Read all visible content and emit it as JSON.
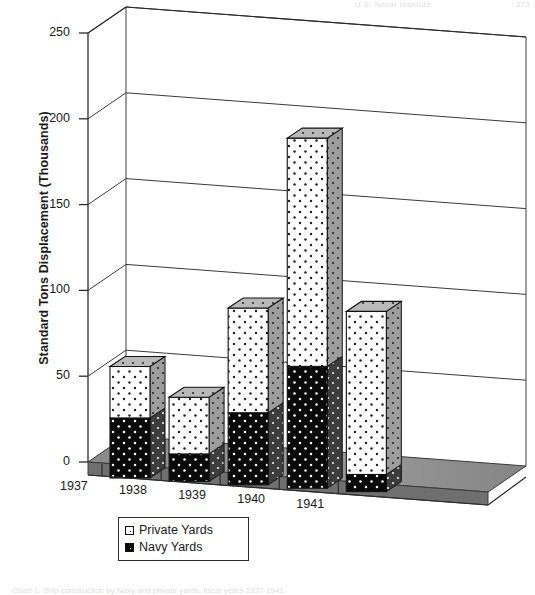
{
  "figure": {
    "running_head": "U.S. Naval Institute",
    "page_number": "373",
    "caption": "Chart 1: Ship construction by Navy and private yards, fiscal years 1937-1941."
  },
  "legend": {
    "position": "bottom-left",
    "entries": [
      {
        "label": "Private Yards",
        "swatch": "priv",
        "color": "#ffffff"
      },
      {
        "label": "Navy Yards",
        "swatch": "navy",
        "color": "#0a0a0a"
      }
    ]
  },
  "chart_data": {
    "type": "bar",
    "subtype": "stacked-column-3d",
    "title": "",
    "xlabel": "",
    "ylabel": "Standard Tons Displacement (Thousands)",
    "categories": [
      "1937",
      "1938",
      "1939",
      "1940",
      "1941"
    ],
    "series": [
      {
        "name": "Navy Yards",
        "values": [
          35,
          16,
          42,
          71,
          10
        ]
      },
      {
        "name": "Private Yards",
        "values": [
          30,
          33,
          61,
          133,
          95
        ]
      }
    ],
    "totals": [
      65,
      49,
      103,
      204,
      105
    ],
    "ylim": [
      0,
      250
    ],
    "yticks": [
      0,
      50,
      100,
      150,
      200,
      250
    ],
    "ytick_labels": [
      "0",
      "50",
      "100",
      "150",
      "200",
      "250"
    ],
    "grid": true,
    "grid_axis": "y",
    "units": "thousands of standard tons displacement"
  },
  "style": {
    "ink": "#2b2b2b",
    "grid": "#3a3a3a",
    "floor_top": "#8f8f8f",
    "floor_front": "#6e6e6e",
    "navy_fill": "#0a0a0a",
    "private_fill": "#ffffff"
  }
}
